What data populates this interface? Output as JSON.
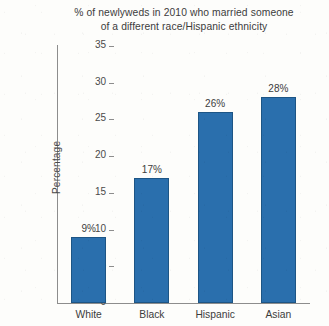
{
  "chart_data": {
    "type": "bar",
    "title": "% of newlyweds in 2010 who married someone of a different race/Hispanic ethnicity",
    "title_lines": [
      "% of newlyweds in 2010 who married someone",
      "of a different race/Hispanic ethnicity"
    ],
    "categories": [
      "White",
      "Black",
      "Hispanic",
      "Asian"
    ],
    "values": [
      9,
      17,
      26,
      28
    ],
    "value_labels": [
      "9%",
      "17%",
      "26%",
      "28%"
    ],
    "xlabel": "",
    "ylabel": "Percentage",
    "ylim": [
      0,
      35
    ],
    "ytick_step": 5,
    "ytick_labels": [
      "0",
      "5",
      "10",
      "15",
      "20",
      "25",
      "30",
      "35"
    ],
    "grid": false,
    "legend": false,
    "bar_color": "#2a6fad",
    "bar_edge_color": "#1d5585",
    "axis_color": "#8d8d8d",
    "text_color": "#3c3c3c",
    "background_color": "#fdfdfb"
  }
}
